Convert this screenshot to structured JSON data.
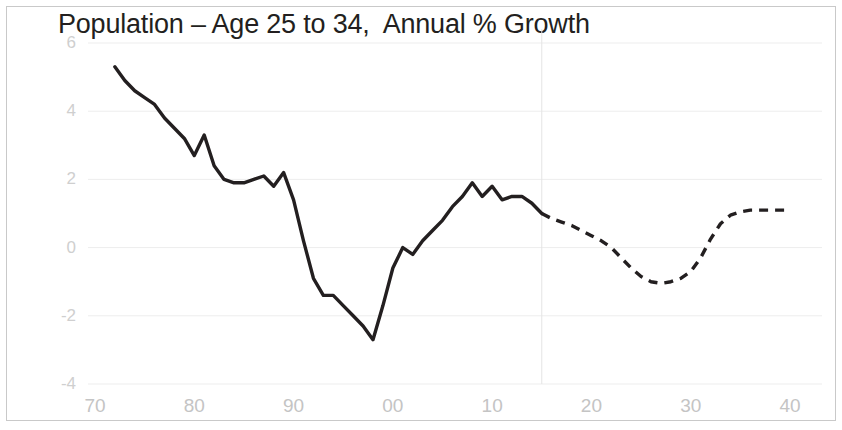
{
  "chart_data": {
    "type": "line",
    "title": "Population – Age 25 to 34,  Annual % Growth",
    "xlabel": "",
    "ylabel": "",
    "xlim": [
      1972,
      2040
    ],
    "ylim": [
      -4,
      6
    ],
    "grid": true,
    "legend_position": "none",
    "y_ticks": [
      "6",
      "4",
      "2",
      "0",
      "-2",
      "-4"
    ],
    "y_tick_values": [
      6,
      4,
      2,
      0,
      -2,
      -4
    ],
    "x_ticks": [
      "70",
      "80",
      "90",
      "00",
      "10",
      "20",
      "30",
      "40"
    ],
    "x_tick_values": [
      1970,
      1980,
      1990,
      2000,
      2010,
      2020,
      2030,
      2040
    ],
    "annotations": [
      {
        "name": "forecast-divider",
        "x": 2015,
        "note": "vertical line separating history from forecast"
      }
    ],
    "series": [
      {
        "name": "Historical",
        "style": "solid",
        "x": [
          1972,
          1973,
          1974,
          1975,
          1976,
          1977,
          1978,
          1979,
          1980,
          1981,
          1982,
          1983,
          1984,
          1985,
          1986,
          1987,
          1988,
          1989,
          1990,
          1991,
          1992,
          1993,
          1994,
          1995,
          1996,
          1997,
          1998,
          1999,
          2000,
          2001,
          2002,
          2003,
          2004,
          2005,
          2006,
          2007,
          2008,
          2009,
          2010,
          2011,
          2012,
          2013,
          2014,
          2015
        ],
        "values": [
          5.3,
          4.9,
          4.6,
          4.4,
          4.2,
          3.8,
          3.5,
          3.2,
          2.7,
          3.3,
          2.4,
          2.0,
          1.9,
          1.9,
          2.0,
          2.1,
          1.8,
          2.2,
          1.4,
          0.2,
          -0.9,
          -1.4,
          -1.4,
          -1.7,
          -2.0,
          -2.3,
          -2.7,
          -1.7,
          -0.6,
          0.0,
          -0.2,
          0.2,
          0.5,
          0.8,
          1.2,
          1.5,
          1.9,
          1.5,
          1.8,
          1.4,
          1.5,
          1.5,
          1.3,
          1.0
        ]
      },
      {
        "name": "Forecast",
        "style": "dashed",
        "x": [
          2015,
          2016,
          2017,
          2018,
          2019,
          2020,
          2021,
          2022,
          2023,
          2024,
          2025,
          2026,
          2027,
          2028,
          2029,
          2030,
          2031,
          2032,
          2033,
          2034,
          2035,
          2036,
          2037,
          2038,
          2039,
          2040
        ],
        "values": [
          1.0,
          0.85,
          0.75,
          0.65,
          0.5,
          0.35,
          0.2,
          0.0,
          -0.3,
          -0.6,
          -0.85,
          -1.0,
          -1.05,
          -1.0,
          -0.9,
          -0.7,
          -0.3,
          0.25,
          0.7,
          0.95,
          1.05,
          1.1,
          1.1,
          1.1,
          1.1,
          1.1
        ]
      }
    ],
    "colors": {
      "line": "#231f20",
      "axis_label": "#c8c8c8",
      "gridline": "#ededed",
      "border": "#c9c9c9",
      "background": "#ffffff"
    }
  }
}
